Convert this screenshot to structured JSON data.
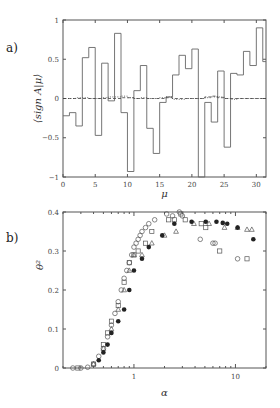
{
  "chart_data": [
    {
      "panel": "a)",
      "type": "line",
      "style": "step",
      "xlabel": "μ",
      "ylabel": "⟨sign A|μ⟩",
      "xlim": [
        0,
        31.5
      ],
      "ylim": [
        -1,
        1
      ],
      "xticks": [
        0,
        5,
        10,
        15,
        20,
        25,
        30
      ],
      "yticks": [
        -1,
        -0.5,
        0,
        0.5,
        1
      ],
      "ytick_labels": [
        "−1",
        "−0.5",
        "0",
        "0.5",
        "1"
      ],
      "grid": false,
      "series": [
        {
          "name": "solid",
          "linestyle": "solid",
          "x": [
            0,
            1,
            2,
            3,
            4,
            5,
            6,
            7,
            8,
            9,
            10,
            11,
            12,
            13,
            14,
            15,
            16,
            17,
            18,
            19,
            20,
            21,
            22,
            23,
            24,
            25,
            26,
            27,
            28,
            29,
            30,
            31
          ],
          "values": [
            -0.22,
            -0.18,
            -0.35,
            0.52,
            0.65,
            -0.47,
            0.45,
            -0.03,
            0.83,
            -0.18,
            -0.93,
            0.1,
            0.42,
            -0.38,
            -0.7,
            -0.05,
            0.02,
            0.3,
            0.55,
            0.38,
            0.63,
            -1.0,
            -0.05,
            -0.3,
            0.35,
            -0.62,
            0.32,
            0.3,
            0.6,
            0.42,
            0.9,
            0.47
          ]
        },
        {
          "name": "dotted",
          "linestyle": "dotted",
          "x": [
            0,
            1,
            2,
            3,
            4,
            5,
            6,
            7,
            8,
            9,
            10,
            11,
            12,
            13,
            14,
            15,
            16,
            17,
            18,
            19,
            20,
            21,
            22,
            23,
            24,
            25,
            26,
            27,
            28,
            29,
            30,
            31
          ],
          "values": [
            0,
            0,
            0.01,
            0.01,
            0,
            0,
            0.01,
            0.02,
            0.02,
            0.03,
            0.01,
            0,
            0.01,
            0,
            0,
            0.01,
            0.02,
            -0.01,
            -0.01,
            0,
            0,
            0,
            0.01,
            0.02,
            0.02,
            0,
            -0.01,
            0,
            0,
            0,
            0,
            0
          ]
        },
        {
          "name": "dashed",
          "linestyle": "dashed",
          "x": [
            0,
            1,
            2,
            3,
            4,
            5,
            6,
            7,
            8,
            9,
            10,
            11,
            12,
            13,
            14,
            15,
            16,
            17,
            18,
            19,
            20,
            21,
            22,
            23,
            24,
            25,
            26,
            27,
            28,
            29,
            30,
            31
          ],
          "values": [
            0,
            0,
            0,
            0,
            0,
            0,
            0,
            0,
            0,
            0.01,
            0.01,
            0,
            0,
            0,
            0,
            0,
            0.01,
            0,
            0,
            0,
            0,
            0,
            0.02,
            0.03,
            0.01,
            0,
            0,
            0,
            0,
            0,
            0,
            0
          ]
        }
      ]
    },
    {
      "panel": "b)",
      "type": "scatter",
      "xlabel": "α",
      "ylabel": "θ²",
      "xscale": "log",
      "xlim": [
        0.2,
        20
      ],
      "ylim": [
        0,
        0.4
      ],
      "xticks": [
        1,
        10
      ],
      "yticks": [
        0,
        0.1,
        0.2,
        0.3,
        0.4
      ],
      "grid": false,
      "series": [
        {
          "name": "open circles",
          "marker": "circle-open",
          "x": [
            0.25,
            0.3,
            0.35,
            0.4,
            0.45,
            0.5,
            0.55,
            0.6,
            0.65,
            0.7,
            0.75,
            0.8,
            0.85,
            0.9,
            0.95,
            1.0,
            1.05,
            1.1,
            1.15,
            1.2,
            1.3,
            1.4,
            1.6,
            2.1,
            2.4,
            2.8,
            3.0,
            4.5,
            6.0,
            6.3,
            10.5
          ],
          "values": [
            0,
            0,
            0.002,
            0.01,
            0.03,
            0.05,
            0.08,
            0.11,
            0.14,
            0.17,
            0.2,
            0.23,
            0.25,
            0.27,
            0.29,
            0.31,
            0.32,
            0.33,
            0.34,
            0.35,
            0.36,
            0.37,
            0.38,
            0.395,
            0.39,
            0.4,
            0.39,
            0.33,
            0.32,
            0.32,
            0.28
          ]
        },
        {
          "name": "open squares",
          "marker": "square-open",
          "x": [
            0.28,
            0.4,
            0.5,
            0.55,
            0.6,
            0.7,
            0.8,
            0.9,
            1.0,
            1.1,
            1.3,
            1.5,
            2.2,
            2.5,
            2.9,
            3.2,
            4.6,
            5.1,
            7.0,
            13.0
          ],
          "values": [
            0,
            0.01,
            0.06,
            0.09,
            0.12,
            0.16,
            0.22,
            0.27,
            0.29,
            0.3,
            0.32,
            0.35,
            0.38,
            0.38,
            0.395,
            0.38,
            0.37,
            0.36,
            0.3,
            0.28
          ]
        },
        {
          "name": "open triangles",
          "marker": "triangle-open",
          "x": [
            0.4,
            0.5,
            0.6,
            0.7,
            0.8,
            0.9,
            1.0,
            1.2,
            1.5,
            2.0,
            2.6,
            3.9,
            5.5,
            7.8,
            10.5,
            13.0,
            14.5
          ],
          "values": [
            0.01,
            0.05,
            0.1,
            0.15,
            0.2,
            0.25,
            0.29,
            0.29,
            0.32,
            0.34,
            0.35,
            0.37,
            0.37,
            0.36,
            0.36,
            0.355,
            0.355
          ]
        },
        {
          "name": "filled circles",
          "marker": "circle-filled",
          "x": [
            0.45,
            0.5,
            0.55,
            0.6,
            0.7,
            0.8,
            0.9,
            1.0,
            1.2,
            1.4,
            1.9,
            2.5,
            3.7,
            5.1,
            6.5,
            7.5,
            8.3,
            10.5,
            15.0
          ],
          "values": [
            0.02,
            0.04,
            0.06,
            0.09,
            0.12,
            0.15,
            0.2,
            0.25,
            0.28,
            0.31,
            0.34,
            0.37,
            0.375,
            0.375,
            0.375,
            0.372,
            0.37,
            0.36,
            0.33
          ]
        }
      ]
    }
  ],
  "labels": {
    "panel_a": "a)",
    "panel_b": "b)"
  }
}
